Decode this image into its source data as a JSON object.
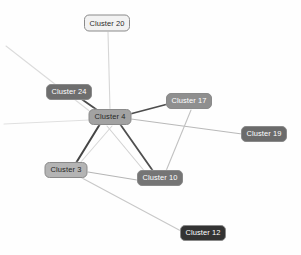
{
  "graph": {
    "title": "Cluster Network Graph",
    "background_color": "#fefefe",
    "width": 301,
    "height": 255,
    "node_border_color": "#8a8a8a",
    "nodes": [
      {
        "id": "cluster-20",
        "label": "Cluster 20",
        "x": 107,
        "y": 23,
        "w": 46,
        "h": 17,
        "fill": "#f2f2f2",
        "text_color": "#2b2b2b"
      },
      {
        "id": "cluster-24",
        "label": "Cluster 24",
        "x": 69,
        "y": 92,
        "w": 46,
        "h": 16,
        "fill": "#6e6e6e",
        "text_color": "#ffffff"
      },
      {
        "id": "cluster-4",
        "label": "Cluster 4",
        "x": 110,
        "y": 117,
        "w": 43,
        "h": 16,
        "fill": "#a2a2a2",
        "text_color": "#262626"
      },
      {
        "id": "cluster-17",
        "label": "Cluster 17",
        "x": 189,
        "y": 101,
        "w": 46,
        "h": 16,
        "fill": "#8f8f8f",
        "text_color": "#ffffff"
      },
      {
        "id": "cluster-19",
        "label": "Cluster 19",
        "x": 264,
        "y": 134,
        "w": 46,
        "h": 16,
        "fill": "#6b6b6b",
        "text_color": "#ffffff"
      },
      {
        "id": "cluster-3",
        "label": "Cluster 3",
        "x": 66,
        "y": 170,
        "w": 43,
        "h": 16,
        "fill": "#b4b4b4",
        "text_color": "#262626"
      },
      {
        "id": "cluster-10",
        "label": "Cluster 10",
        "x": 160,
        "y": 178,
        "w": 46,
        "h": 16,
        "fill": "#757575",
        "text_color": "#ffffff"
      },
      {
        "id": "cluster-12",
        "label": "Cluster 12",
        "x": 203,
        "y": 233,
        "w": 46,
        "h": 16,
        "fill": "#333333",
        "text_color": "#ffffff"
      }
    ],
    "edges": [
      {
        "id": "edge-4-20",
        "source": "cluster-4",
        "target": "cluster-20",
        "x1": 110,
        "y1": 110,
        "x2": 108,
        "y2": 32,
        "color": "#d6d6d6",
        "width": 1.1
      },
      {
        "id": "edge-4-24",
        "source": "cluster-4",
        "target": "cluster-24",
        "x1": 100,
        "y1": 112,
        "x2": 80,
        "y2": 98,
        "color": "#4a4a4a",
        "width": 1.8
      },
      {
        "id": "edge-4-17",
        "source": "cluster-4",
        "target": "cluster-17",
        "x1": 130,
        "y1": 114,
        "x2": 168,
        "y2": 104,
        "color": "#4d4d4d",
        "width": 1.8
      },
      {
        "id": "edge-4-3",
        "source": "cluster-4",
        "target": "cluster-3",
        "x1": 100,
        "y1": 124,
        "x2": 76,
        "y2": 163,
        "color": "#454545",
        "width": 2.0
      },
      {
        "id": "edge-4-10",
        "source": "cluster-4",
        "target": "cluster-10",
        "x1": 120,
        "y1": 124,
        "x2": 153,
        "y2": 171,
        "color": "#4f4f4f",
        "width": 1.8
      },
      {
        "id": "edge-4-19",
        "source": "cluster-4",
        "target": "cluster-19",
        "x1": 131,
        "y1": 119,
        "x2": 242,
        "y2": 134,
        "color": "#b9b9b9",
        "width": 1.1
      },
      {
        "id": "edge-4-offleft-upper",
        "source": "cluster-4",
        "target": "offscreen-left-upper",
        "x1": 92,
        "y1": 113,
        "x2": 6,
        "y2": 46,
        "color": "#dcdcdc",
        "width": 1.1
      },
      {
        "id": "edge-4-offleft-lower",
        "source": "cluster-4",
        "target": "offscreen-left-lower",
        "x1": 90,
        "y1": 120,
        "x2": 4,
        "y2": 124,
        "color": "#e0e0e0",
        "width": 1.1
      },
      {
        "id": "edge-17-10",
        "source": "cluster-17",
        "target": "cluster-10",
        "x1": 191,
        "y1": 110,
        "x2": 166,
        "y2": 171,
        "color": "#c2c2c2",
        "width": 1.1
      },
      {
        "id": "edge-4-10-light",
        "source": "cluster-4",
        "target": "cluster-10",
        "x1": 107,
        "y1": 126,
        "x2": 146,
        "y2": 173,
        "color": "#d2d2d2",
        "width": 1.1
      },
      {
        "id": "edge-3-4-light",
        "source": "cluster-3",
        "target": "cluster-4",
        "x1": 80,
        "y1": 163,
        "x2": 112,
        "y2": 126,
        "color": "#d8d8d8",
        "width": 1.1
      },
      {
        "id": "edge-3-10",
        "source": "cluster-3",
        "target": "cluster-10",
        "x1": 88,
        "y1": 172,
        "x2": 137,
        "y2": 180,
        "color": "#b5b5b5",
        "width": 1.1
      },
      {
        "id": "edge-3-12",
        "source": "cluster-3",
        "target": "cluster-12",
        "x1": 82,
        "y1": 178,
        "x2": 181,
        "y2": 231,
        "color": "#c8c8c8",
        "width": 1.1
      }
    ]
  }
}
